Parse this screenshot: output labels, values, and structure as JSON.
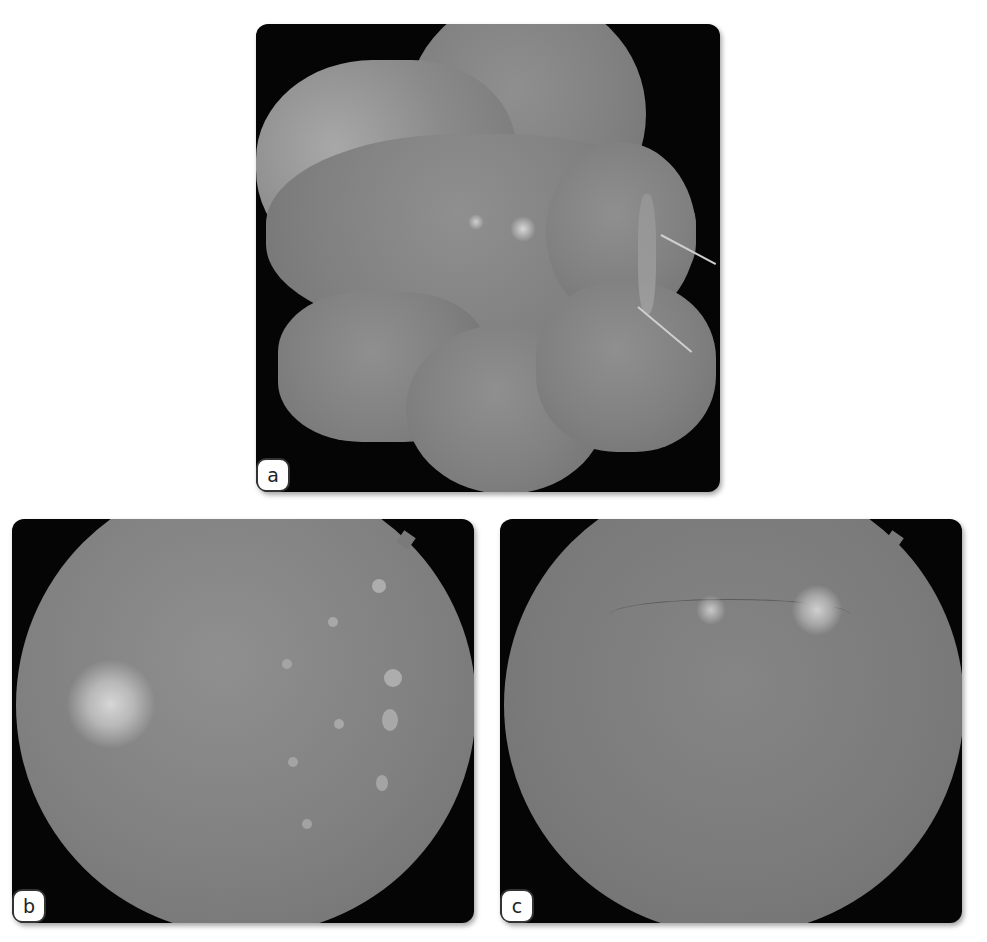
{
  "figure": {
    "panels": [
      {
        "id": "a",
        "label": "a",
        "description": "Wide-field fundus montage with two arrows pointing at a line of lesions"
      },
      {
        "id": "b",
        "label": "b",
        "description": "Fundus photo with multiple whitish spots arranged in vertical lines"
      },
      {
        "id": "c",
        "label": "c",
        "description": "Fundus photo showing optic disc and small bright macular spot"
      }
    ],
    "colors": {
      "background": "#ffffff",
      "panel_frame": "#050505",
      "fundus": "#808080",
      "label_bg": "#ffffff",
      "arrow": "#cfcfcf"
    }
  }
}
